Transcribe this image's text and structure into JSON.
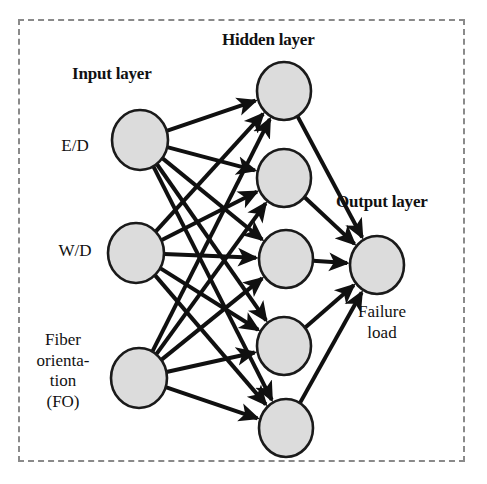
{
  "diagram": {
    "type": "neural-network-architecture",
    "title_labels": {
      "input": "Input layer",
      "hidden": "Hidden layer",
      "output": "Output layer"
    },
    "colors": {
      "node_fill": "#dcdcdc",
      "node_stroke": "#1a1a1a",
      "edge": "#101010",
      "frame": "#8a8a8a",
      "text": "#111111",
      "background": "#ffffff"
    },
    "frame": {
      "style": "dashed",
      "x": 18,
      "y": 19,
      "width": 447,
      "height": 443
    },
    "layers": [
      {
        "name": "input",
        "title": "Input layer",
        "node_count": 3,
        "nodes": [
          {
            "id": "i1",
            "label": "E/D",
            "label_lines": [
              "E/D"
            ],
            "cx": 140,
            "cy": 140,
            "rx": 28,
            "ry": 30
          },
          {
            "id": "i2",
            "label": "W/D",
            "label_lines": [
              "W/D"
            ],
            "cx": 136,
            "cy": 253,
            "rx": 28,
            "ry": 30
          },
          {
            "id": "i3",
            "label": "Fiber orientation (FO)",
            "label_lines": [
              "Fiber",
              "orienta-",
              "tion",
              "(FO)"
            ],
            "cx": 139,
            "cy": 378,
            "rx": 28,
            "ry": 30
          }
        ]
      },
      {
        "name": "hidden",
        "title": "Hidden layer",
        "node_count": 5,
        "nodes": [
          {
            "id": "h1",
            "label": "",
            "cx": 284,
            "cy": 91,
            "rx": 27,
            "ry": 29
          },
          {
            "id": "h2",
            "label": "",
            "cx": 284,
            "cy": 178,
            "rx": 27,
            "ry": 29
          },
          {
            "id": "h3",
            "label": "",
            "cx": 286,
            "cy": 259,
            "rx": 27,
            "ry": 29
          },
          {
            "id": "h4",
            "label": "",
            "cx": 284,
            "cy": 346,
            "rx": 27,
            "ry": 29
          },
          {
            "id": "h5",
            "label": "",
            "cx": 286,
            "cy": 428,
            "rx": 27,
            "ry": 29
          }
        ]
      },
      {
        "name": "output",
        "title": "Output layer",
        "node_count": 1,
        "nodes": [
          {
            "id": "o1",
            "label": "Failure load",
            "label_lines": [
              "Failure",
              "load"
            ],
            "cx": 377,
            "cy": 265,
            "rx": 27,
            "ry": 29
          }
        ]
      }
    ],
    "connections": {
      "input_to_hidden": "fully-connected",
      "hidden_to_output": "fully-connected",
      "edge_count": 20,
      "arrow_heads": true,
      "direction": "left-to-right"
    }
  }
}
